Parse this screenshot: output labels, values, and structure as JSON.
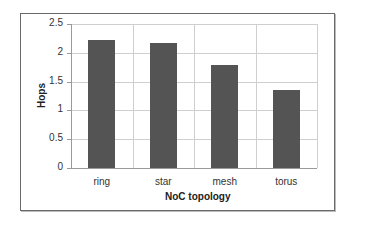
{
  "chart_data": {
    "type": "bar",
    "title": "",
    "xlabel": "NoC topology",
    "ylabel": "Hops",
    "categories": [
      "ring",
      "star",
      "mesh",
      "torus"
    ],
    "values": [
      2.22,
      2.17,
      1.79,
      1.35
    ],
    "ylim": [
      0,
      2.5
    ],
    "yticks": [
      "0",
      "0.5",
      "1",
      "1.5",
      "2",
      "2.5"
    ],
    "grid": true,
    "legend": null,
    "bar_color": "#545454"
  }
}
